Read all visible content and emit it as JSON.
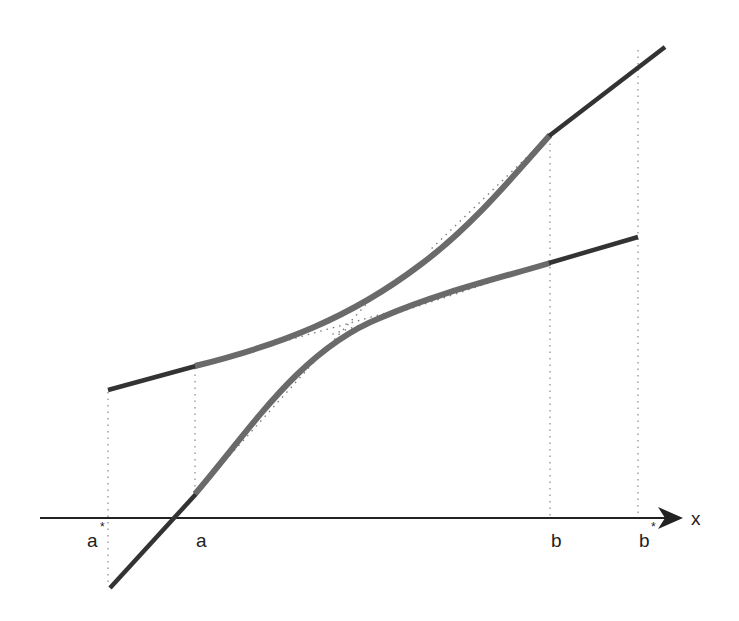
{
  "diagram": {
    "axis": {
      "label": "x"
    },
    "labels": {
      "a_star": "a",
      "a": "a",
      "b": "b",
      "b_star": "b",
      "star": "*"
    },
    "colors": {
      "line": "#333333",
      "curve": "#6a6a6a",
      "dotted": "#888888",
      "axis": "#222222"
    },
    "points": {
      "a_star_x": 108,
      "a_x": 195,
      "b_x": 550,
      "b_star_x": 638,
      "axis_y": 518
    }
  }
}
